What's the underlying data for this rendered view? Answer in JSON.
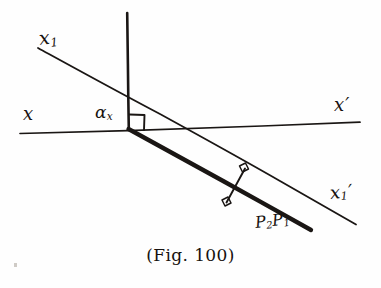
{
  "figure": {
    "caption": "(Fig. 100)",
    "background_color": "#fefefe",
    "ink_color": "#1a1614",
    "width": 381,
    "height": 288
  },
  "labels": {
    "x1": {
      "base": "x",
      "sub": "1",
      "prime": ""
    },
    "x": {
      "base": "x",
      "sub": "",
      "prime": ""
    },
    "x_prime": {
      "base": "x",
      "sub": "",
      "prime": "′"
    },
    "x1_prime": {
      "base": "x",
      "sub": "1",
      "prime": "′"
    },
    "alpha_x": {
      "base": "α",
      "sub": "x",
      "prime": ""
    },
    "p2p1": {
      "base": "P",
      "sub": "2",
      "base2": "P",
      "sub2": "1"
    }
  },
  "geometry": {
    "axis_x": {
      "name": "horizontal-axis-x-xprime",
      "x1": 20,
      "y1": 133,
      "x2": 360,
      "y2": 122
    },
    "vertical": {
      "name": "vertical-axis",
      "x1": 127,
      "y1": 13,
      "x2": 129,
      "y2": 128
    },
    "inclined": {
      "name": "inclined-axis-x1-x1prime",
      "x1": 38,
      "y1": 48,
      "x2": 356,
      "y2": 224
    },
    "chord": {
      "name": "chord-p2-p1",
      "x1": 128,
      "y1": 128,
      "x2": 311,
      "y2": 230
    },
    "perpendicular": {
      "name": "perpendicular-distance",
      "x1": 226,
      "y1": 203,
      "x2": 245,
      "y2": 168
    },
    "right_angle_origin": {
      "name": "right-angle-marker-origin",
      "x": 129,
      "y": 113,
      "size": 15
    },
    "right_angle_upper": {
      "name": "right-angle-marker-upper",
      "x": 244,
      "y": 169,
      "size": 7
    },
    "right_angle_lower": {
      "name": "right-angle-marker-lower",
      "x": 227,
      "y": 202,
      "size": 7
    }
  }
}
